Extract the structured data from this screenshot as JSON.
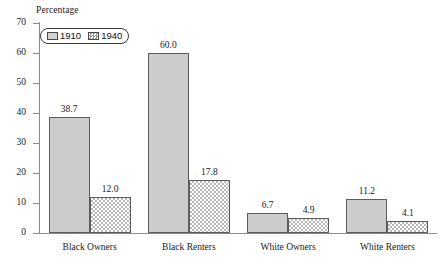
{
  "chart_data": {
    "type": "bar",
    "title": "",
    "subtitle": "",
    "xlabel": "",
    "ylabel": "Percentage",
    "ylim": [
      0,
      70
    ],
    "yticks": [
      0,
      10,
      20,
      30,
      40,
      50,
      60,
      70
    ],
    "grid": false,
    "legend_position": "top-left",
    "categories": [
      "Black Owners",
      "Black Renters",
      "White Owners",
      "White Renters"
    ],
    "series": [
      {
        "name": "1910",
        "values": [
          38.7,
          60.0,
          6.7,
          11.2
        ],
        "labels": [
          "38.7",
          "60.0",
          "6.7",
          "11.2"
        ],
        "fill": "solid-gray",
        "color": "#cccccc"
      },
      {
        "name": "1940",
        "values": [
          12.0,
          17.8,
          4.9,
          4.1
        ],
        "labels": [
          "12.0",
          "17.8",
          "4.9",
          "4.1"
        ],
        "fill": "checkerboard",
        "color": "#b8b8b8"
      }
    ]
  },
  "legend": {
    "items": [
      {
        "label": "1910",
        "swatch": "solid-gray-swatch"
      },
      {
        "label": "1940",
        "swatch": "checkerboard-swatch"
      }
    ]
  },
  "axis": {
    "y_title": "Percentage",
    "y_tick_labels": [
      "70",
      "60",
      "50",
      "40",
      "30",
      "20",
      "10",
      "0"
    ]
  }
}
